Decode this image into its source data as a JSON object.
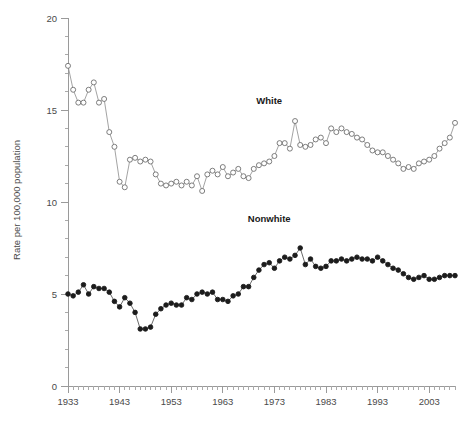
{
  "chart_data": {
    "type": "line",
    "title": "",
    "xlabel": "",
    "ylabel": "Rate per 100,000 population",
    "xlim": [
      1933,
      2008
    ],
    "ylim": [
      0,
      20
    ],
    "y_ticks": [
      0,
      5,
      10,
      15,
      20
    ],
    "y_minor_step": 1,
    "x_ticks": [
      1933,
      1943,
      1953,
      1963,
      1973,
      1983,
      1993,
      2003
    ],
    "x_minor_step": 1,
    "grid": false,
    "legend_position": "inline-annotation",
    "x": [
      1933,
      1934,
      1935,
      1936,
      1937,
      1938,
      1939,
      1940,
      1941,
      1942,
      1943,
      1944,
      1945,
      1946,
      1947,
      1948,
      1949,
      1950,
      1951,
      1952,
      1953,
      1954,
      1955,
      1956,
      1957,
      1958,
      1959,
      1960,
      1961,
      1962,
      1963,
      1964,
      1965,
      1966,
      1967,
      1968,
      1969,
      1970,
      1971,
      1972,
      1973,
      1974,
      1975,
      1976,
      1977,
      1978,
      1979,
      1980,
      1981,
      1982,
      1983,
      1984,
      1985,
      1986,
      1987,
      1988,
      1989,
      1990,
      1991,
      1992,
      1993,
      1994,
      1995,
      1996,
      1997,
      1998,
      1999,
      2000,
      2001,
      2002,
      2003,
      2004,
      2005,
      2006,
      2007,
      2008
    ],
    "series": [
      {
        "name": "White",
        "marker": "open-circle",
        "color": "#6f6f6f",
        "values": [
          17.4,
          16.1,
          15.4,
          15.4,
          16.1,
          16.5,
          15.4,
          15.6,
          13.8,
          13.0,
          11.1,
          10.8,
          12.3,
          12.4,
          12.2,
          12.3,
          12.2,
          11.5,
          11.0,
          10.9,
          11.0,
          11.1,
          10.9,
          11.1,
          10.9,
          11.4,
          10.6,
          11.5,
          11.7,
          11.5,
          11.9,
          11.4,
          11.6,
          11.8,
          11.4,
          11.3,
          11.8,
          12.0,
          12.1,
          12.2,
          12.5,
          13.2,
          13.2,
          12.9,
          14.4,
          13.1,
          13.0,
          13.1,
          13.4,
          13.5,
          13.2,
          14.0,
          13.8,
          14.0,
          13.8,
          13.7,
          13.5,
          13.4,
          13.1,
          12.8,
          12.7,
          12.7,
          12.5,
          12.3,
          12.1,
          11.8,
          11.9,
          11.8,
          12.1,
          12.2,
          12.3,
          12.5,
          12.9,
          13.2,
          13.5,
          14.3
        ]
      },
      {
        "name": "Nonwhite",
        "marker": "filled-circle",
        "color": "#1c1c1c",
        "values": [
          5.0,
          4.9,
          5.1,
          5.5,
          5.0,
          5.4,
          5.3,
          5.3,
          5.1,
          4.6,
          4.3,
          4.8,
          4.5,
          4.0,
          3.1,
          3.1,
          3.2,
          3.9,
          4.2,
          4.4,
          4.5,
          4.4,
          4.4,
          4.8,
          4.7,
          5.0,
          5.1,
          5.0,
          5.1,
          4.7,
          4.7,
          4.6,
          4.9,
          5.0,
          5.4,
          5.4,
          5.9,
          6.3,
          6.6,
          6.7,
          6.4,
          6.8,
          7.0,
          6.9,
          7.1,
          7.5,
          6.6,
          6.9,
          6.5,
          6.4,
          6.5,
          6.8,
          6.8,
          6.9,
          6.8,
          6.9,
          7.0,
          6.9,
          6.9,
          6.8,
          7.0,
          6.8,
          6.6,
          6.4,
          6.3,
          6.1,
          5.9,
          5.8,
          5.9,
          6.0,
          5.8,
          5.8,
          5.9,
          6.0,
          6.0,
          6.0
        ]
      }
    ],
    "annotations": [
      {
        "text": "White",
        "x": 1972,
        "y": 15.3
      },
      {
        "text": "Nonwhite",
        "x": 1972,
        "y": 8.9
      }
    ]
  },
  "axis": {
    "y_title": "Rate per 100,000 population",
    "y_tick_labels": [
      "20",
      "15",
      "10",
      "5",
      "0"
    ],
    "x_tick_labels": [
      "1933",
      "1943",
      "1953",
      "1963",
      "1973",
      "1983",
      "1993",
      "2003"
    ]
  },
  "caption": {
    "text": ""
  }
}
